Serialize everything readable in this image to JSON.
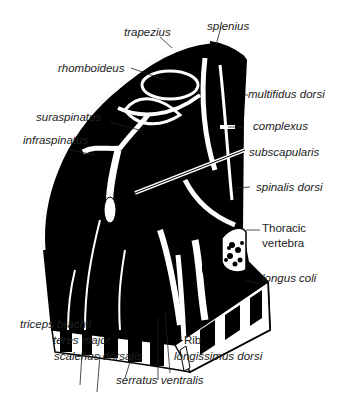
{
  "diagram": {
    "type": "anatomical cross-section",
    "colors": {
      "muscle": "#000000",
      "fascia": "#ffffff",
      "outline": "#000000",
      "text": "#222222"
    },
    "labels": {
      "trapezius": "trapezius",
      "splenius": "splenius",
      "rhomboideus": "rhomboideus",
      "multifidus_dorsi": "multifidus dorsi",
      "complexus": "complexus",
      "suraspinatus": "suraspinatus",
      "infraspinatus": "infraspinatus",
      "subscapularis": "subscapularis",
      "spinalis_dorsi": "spinalis dorsi",
      "thoracic_vertebra_1": "Thoracic",
      "thoracic_vertebra_2": "vertebra",
      "longus_coli": "longus coli",
      "triceps_brachii": "triceps brachii",
      "teres_major": "teres major",
      "scalenus_dorsalis": "scalenus dorsalis",
      "rib": "Rib",
      "longissimus_dorsi": "longissimus  dorsi",
      "serratus_ventralis": "serratus ventralis"
    }
  }
}
